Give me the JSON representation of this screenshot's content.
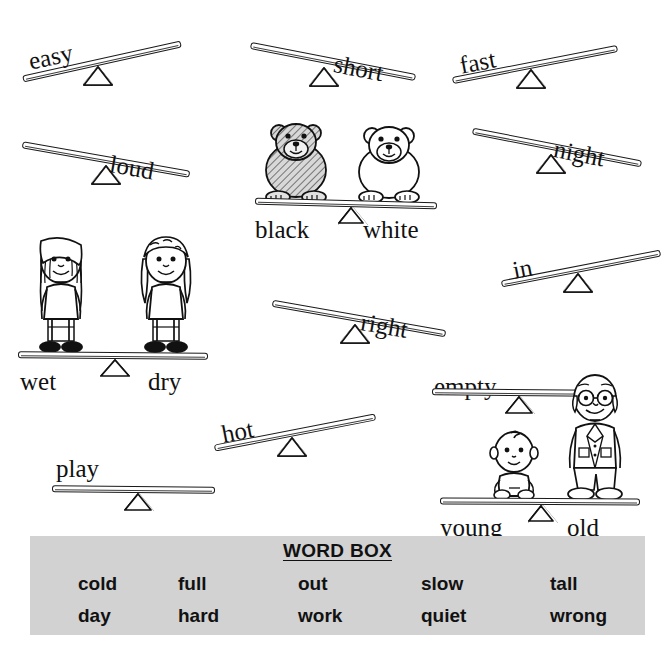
{
  "worksheet": {
    "type": "opposites-seesaw-worksheet",
    "items": [
      {
        "id": "easy",
        "label": "easy",
        "tilt": "up-right",
        "label_side": "left",
        "rotated": true,
        "has_figures": false
      },
      {
        "id": "short",
        "label": "short",
        "tilt": "down-right",
        "label_side": "right",
        "rotated": true,
        "has_figures": false
      },
      {
        "id": "fast",
        "label": "fast",
        "tilt": "up-right",
        "label_side": "left",
        "rotated": true,
        "has_figures": false
      },
      {
        "id": "loud",
        "label": "loud",
        "tilt": "down-right",
        "label_side": "right",
        "rotated": true,
        "has_figures": false
      },
      {
        "id": "night",
        "label": "night",
        "tilt": "down-right",
        "label_side": "right",
        "rotated": true,
        "has_figures": false
      },
      {
        "id": "in",
        "label": "in",
        "tilt": "up-right",
        "label_side": "left",
        "rotated": true,
        "has_figures": false
      },
      {
        "id": "right",
        "label": "right",
        "tilt": "down-right",
        "label_side": "right",
        "rotated": true,
        "has_figures": false
      },
      {
        "id": "hot",
        "label": "hot",
        "tilt": "up-right",
        "label_side": "left",
        "rotated": true,
        "has_figures": false
      },
      {
        "id": "play",
        "label": "play",
        "tilt": "level",
        "label_side": "left",
        "rotated": false,
        "has_figures": false
      },
      {
        "id": "empty",
        "label": "empty",
        "tilt": "level",
        "label_side": "left",
        "rotated": false,
        "has_figures": false
      }
    ],
    "examples": [
      {
        "id": "black-white",
        "left_label": "black",
        "right_label": "white",
        "left_figure": "dark-bear-figure",
        "right_figure": "light-bear-figure",
        "tilt": "level"
      },
      {
        "id": "wet-dry",
        "left_label": "wet",
        "right_label": "dry",
        "left_figure": "wet-girl-figure",
        "right_figure": "dry-girl-figure",
        "tilt": "level"
      },
      {
        "id": "young-old",
        "left_label": "young",
        "right_label": "old",
        "left_figure": "baby-figure",
        "right_figure": "old-man-figure",
        "tilt": "level"
      }
    ]
  },
  "word_box": {
    "title": "WORD BOX",
    "background_color": "#d2d2d2",
    "rows": [
      [
        "cold",
        "full",
        "out",
        "slow",
        "tall"
      ],
      [
        "day",
        "hard",
        "work",
        "quiet",
        "wrong"
      ]
    ],
    "words": [
      "cold",
      "full",
      "out",
      "slow",
      "tall",
      "day",
      "hard",
      "work",
      "quiet",
      "wrong"
    ]
  },
  "colors": {
    "ink": "#111111",
    "paper": "#ffffff",
    "wordbox_bg": "#d2d2d2"
  }
}
